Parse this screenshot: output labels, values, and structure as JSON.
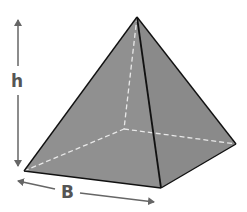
{
  "diagram": {
    "type": "square-pyramid",
    "labels": {
      "height": "h",
      "base": "B"
    },
    "colors": {
      "face": "#8f8f8f",
      "edge": "#111111",
      "hidden_edge": "#e6e6e6",
      "arrow": "#666666",
      "label": "#555555"
    }
  }
}
